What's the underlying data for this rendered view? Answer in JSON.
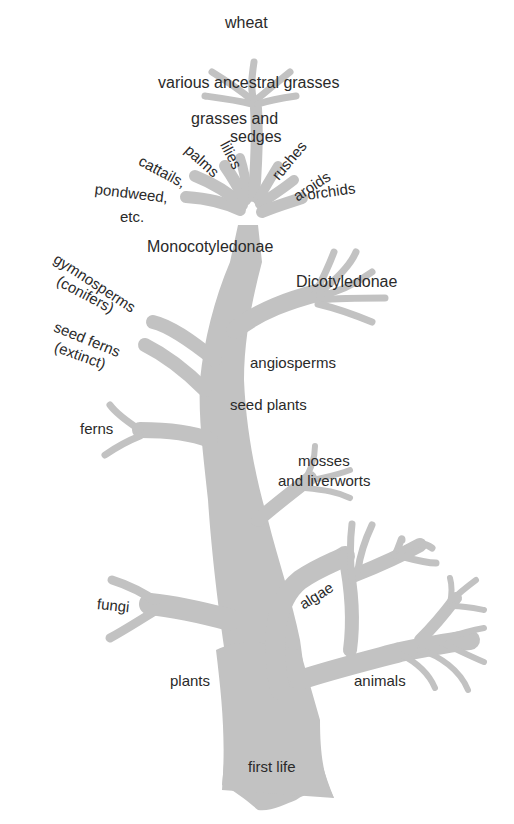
{
  "diagram": {
    "type": "evolutionary tree",
    "colors": {
      "tree_fill": "#c2c2c2",
      "text": "#2a2a2a",
      "background": "#ffffff"
    },
    "labels": {
      "wheat": "wheat",
      "ancestral_grasses": "various ancestral grasses",
      "grasses_sedges_1": "grasses and",
      "grasses_sedges_2": "sedges",
      "cattails": "cattails,",
      "palms": "palms",
      "lilies": "lilies",
      "rushes": "rushes",
      "aroids": "aroids",
      "orchids": "orchids",
      "pondweed_1": "pondweed,",
      "pondweed_2": "etc.",
      "monocotyledonae": "Monocotyledonae",
      "dicotyledonae": "Dicotyledonae",
      "gymnosperms_1": "gymnosperms",
      "gymnosperms_2": "(conifers)",
      "seed_ferns_1": "seed ferns",
      "seed_ferns_2": "(extinct)",
      "angiosperms": "angiosperms",
      "seed_plants": "seed plants",
      "ferns": "ferns",
      "mosses_1": "mosses",
      "mosses_2": "and liverworts",
      "algae": "algae",
      "fungi": "fungi",
      "plants": "plants",
      "animals": "animals",
      "first_life": "first life"
    }
  }
}
